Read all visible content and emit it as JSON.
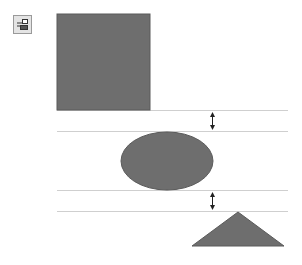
{
  "toolbar": {
    "distribute_button": {
      "icon": "distribute-vertically-icon",
      "tooltip": ""
    }
  },
  "diagram": {
    "shapes": [
      {
        "type": "rectangle",
        "name": "square"
      },
      {
        "type": "ellipse",
        "name": "oval"
      },
      {
        "type": "triangle",
        "name": "triangle"
      }
    ],
    "spacing_indicators": [
      {
        "between": [
          "square",
          "oval"
        ],
        "meaning": "equal gap"
      },
      {
        "between": [
          "oval",
          "triangle"
        ],
        "meaning": "equal gap"
      }
    ],
    "colors": {
      "shape_fill": "#6e6e6e",
      "shape_stroke": "#5a5a5a",
      "guide_line": "#cfcfcf",
      "arrow": "#222222"
    }
  }
}
